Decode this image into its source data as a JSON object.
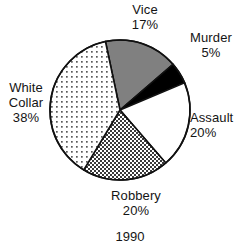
{
  "chart_data": {
    "type": "pie",
    "title": "",
    "caption": "1990",
    "legend_position": "none",
    "total": 100,
    "unit": "%",
    "slices": [
      {
        "label": "Vice",
        "value": 17,
        "value_text": "17%",
        "fill": "solid-gray",
        "color": "#808080",
        "start_angle": 348,
        "end_angle": 409.2
      },
      {
        "label": "Murder",
        "value": 5,
        "value_text": "5%",
        "fill": "solid-black",
        "color": "#000000",
        "start_angle": 409.2,
        "end_angle": 427.2
      },
      {
        "label": "Assault",
        "value": 20,
        "value_text": "20%",
        "fill": "white",
        "color": "#ffffff",
        "start_angle": 427.2,
        "end_angle": 499.2
      },
      {
        "label": "Robbery",
        "value": 20,
        "value_text": "20%",
        "fill": "checkerboard-dense",
        "color": "#9a9a9a",
        "start_angle": 499.2,
        "end_angle": 571.2
      },
      {
        "label": "White Collar",
        "value": 38,
        "value_text": "38%",
        "fill": "dots-sparse",
        "color": "#e8e8e8",
        "start_angle": 571.2,
        "end_angle": 708
      }
    ]
  },
  "labels": {
    "vice": {
      "name": "Vice",
      "value": "17%"
    },
    "murder": {
      "name": "Murder",
      "value": "5%"
    },
    "assault": {
      "name": "Assault",
      "value": "20%"
    },
    "robbery": {
      "name": "Robbery",
      "value": "20%"
    },
    "whitecollar": {
      "name_line1": "White",
      "name_line2": "Collar",
      "value": "38%"
    }
  },
  "caption": "1990",
  "geometry": {
    "center_x": 120,
    "center_y": 110,
    "radius": 70,
    "stroke_color": "#111111",
    "stroke_width": 1.6
  }
}
